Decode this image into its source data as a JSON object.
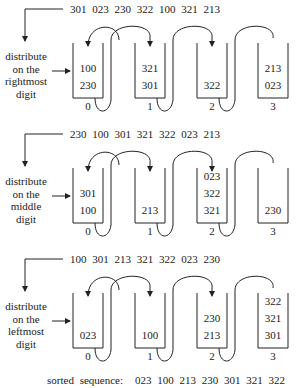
{
  "passes": [
    {
      "input_sequence": "301 023 230 322 100 321 213",
      "label": [
        "distribute",
        "on the",
        "rightmost",
        "digit"
      ],
      "buckets": [
        {
          "index": "0",
          "items_top_to_bottom": [
            "100",
            "230"
          ]
        },
        {
          "index": "1",
          "items_top_to_bottom": [
            "321",
            "301"
          ]
        },
        {
          "index": "2",
          "items_top_to_bottom": [
            "322"
          ]
        },
        {
          "index": "3",
          "items_top_to_bottom": [
            "213",
            "023"
          ]
        }
      ]
    },
    {
      "input_sequence": "230 100 301 321 322 023 213",
      "label": [
        "distribute",
        "on the",
        "middle",
        "digit"
      ],
      "buckets": [
        {
          "index": "0",
          "items_top_to_bottom": [
            "301",
            "100"
          ]
        },
        {
          "index": "1",
          "items_top_to_bottom": [
            "213"
          ]
        },
        {
          "index": "2",
          "items_top_to_bottom": [
            "023",
            "322",
            "321"
          ]
        },
        {
          "index": "3",
          "items_top_to_bottom": [
            "230"
          ]
        }
      ]
    },
    {
      "input_sequence": "100 301 213 321 322 023 230",
      "label": [
        "distribute",
        "on the",
        "leftmost",
        "digit"
      ],
      "buckets": [
        {
          "index": "0",
          "items_top_to_bottom": [
            "023"
          ]
        },
        {
          "index": "1",
          "items_top_to_bottom": [
            "100"
          ]
        },
        {
          "index": "2",
          "items_top_to_bottom": [
            "230",
            "213"
          ]
        },
        {
          "index": "3",
          "items_top_to_bottom": [
            "322",
            "321",
            "301"
          ]
        }
      ]
    }
  ],
  "result": {
    "label": "sorted sequence:",
    "sequence": "023 100 213 230 301 321 322"
  }
}
